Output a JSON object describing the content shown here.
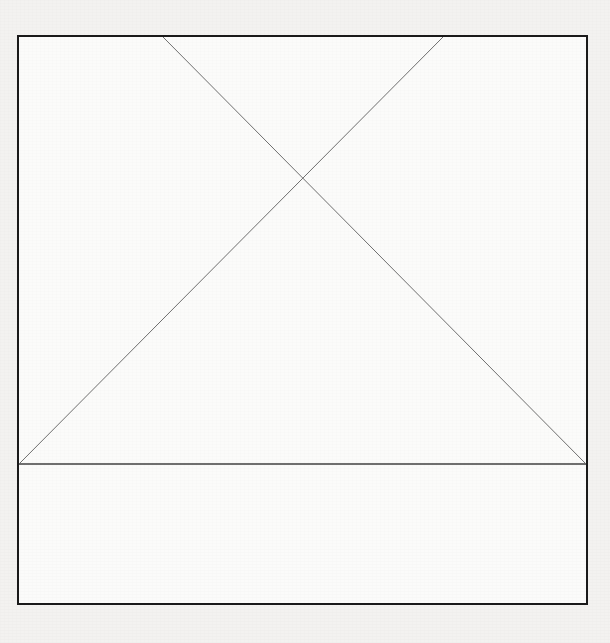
{
  "canvas": {
    "width": 610,
    "height": 643,
    "outer_background_color": "#f3f2f0",
    "panel_background_color": "#fbfbfa",
    "title": "Image Placeholder"
  },
  "frame": {
    "name": "placeholder-frame",
    "x": 18,
    "y": 36,
    "width": 569,
    "height": 568,
    "stroke_color": "#1a1a1a",
    "stroke_width": 2,
    "fill_color": "#fbfbfa"
  },
  "graphic": {
    "description": "Missing-image placeholder: two crossing diagonals forming an X above a horizontal baseline, creating a triangle inside a bordered rectangle.",
    "stroke_color": "#6f6f6f",
    "stroke_width": 1,
    "intersection_point": {
      "x": 302,
      "y": 188
    },
    "lines": [
      {
        "name": "diagonal-down-right",
        "x1": 163,
        "y1": 37,
        "x2": 586,
        "y2": 464
      },
      {
        "name": "diagonal-down-left",
        "x1": 443,
        "y1": 37,
        "x2": 19,
        "y2": 464
      },
      {
        "name": "baseline-horizontal",
        "x1": 19,
        "y1": 464,
        "x2": 586,
        "y2": 464
      }
    ]
  },
  "labels": {
    "none": ""
  }
}
